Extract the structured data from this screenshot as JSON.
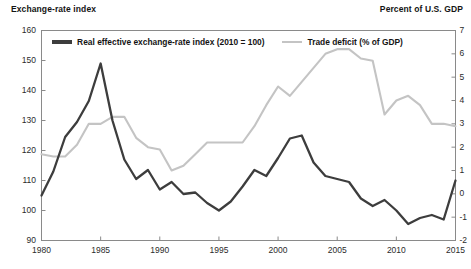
{
  "axis_titles": {
    "left": "Exchange-rate index",
    "right": "Percent of U.S. GDP"
  },
  "legend": {
    "items": [
      {
        "label": "Real effective exchange-rate index (2010 = 100)",
        "color": "#3d3d3d"
      },
      {
        "label": "Trade deficit (% of GDP)",
        "color": "#c4c4c4"
      }
    ]
  },
  "chart_data": {
    "type": "line",
    "title": "",
    "subtitle": "",
    "xlabel": "",
    "ylabel": "Exchange-rate index",
    "y2label": "Percent of U.S. GDP",
    "grid": false,
    "legend_position": "top-center-inside",
    "xlim": [
      1980,
      2015
    ],
    "xticks": [
      1980,
      1985,
      1990,
      1995,
      2000,
      2005,
      2010,
      2015
    ],
    "xticklabels": [
      "1980",
      "1985",
      "1990",
      "1995",
      "2000",
      "2005",
      "2010",
      "2015"
    ],
    "ylim": [
      90,
      160
    ],
    "yticks": [
      90,
      100,
      110,
      120,
      130,
      140,
      150,
      160
    ],
    "yticklabels": [
      "90",
      "100",
      "110",
      "120",
      "130",
      "140",
      "150",
      "160"
    ],
    "y2lim": [
      -2,
      7
    ],
    "y2ticks": [
      -2,
      -1,
      0,
      1,
      2,
      3,
      4,
      5,
      6,
      7
    ],
    "y2ticklabels": [
      "-2",
      "-1",
      "0",
      "1",
      "2",
      "3",
      "4",
      "5",
      "6",
      "7"
    ],
    "x": [
      1980,
      1981,
      1982,
      1983,
      1984,
      1985,
      1986,
      1987,
      1988,
      1989,
      1990,
      1991,
      1992,
      1993,
      1994,
      1995,
      1996,
      1997,
      1998,
      1999,
      2000,
      2001,
      2002,
      2003,
      2004,
      2005,
      2006,
      2007,
      2008,
      2009,
      2010,
      2011,
      2012,
      2013,
      2014,
      2015
    ],
    "series": [
      {
        "name": "Real effective exchange-rate index (2010 = 100)",
        "axis": "left",
        "color": "#3d3d3d",
        "values": [
          105.0,
          113.0,
          124.5,
          129.5,
          136.5,
          149.0,
          130.0,
          117.0,
          110.5,
          113.5,
          107.0,
          109.5,
          105.5,
          106.0,
          102.5,
          100.0,
          103.0,
          108.0,
          113.5,
          111.5,
          117.5,
          124.0,
          125.0,
          116.0,
          111.5,
          110.5,
          109.5,
          104.0,
          101.5,
          103.5,
          100.0,
          95.5,
          97.5,
          98.5,
          97.0,
          110.0
        ]
      },
      {
        "name": "Trade deficit (% of GDP)",
        "axis": "right",
        "color": "#c4c4c4",
        "values": [
          1.7,
          1.6,
          1.6,
          2.1,
          3.0,
          3.0,
          3.3,
          3.3,
          2.4,
          2.0,
          1.9,
          1.0,
          1.2,
          1.7,
          2.2,
          2.2,
          2.2,
          2.2,
          2.9,
          3.8,
          4.6,
          4.2,
          4.8,
          5.4,
          6.0,
          6.2,
          6.2,
          5.8,
          5.7,
          3.4,
          4.0,
          4.2,
          3.8,
          3.0,
          3.0,
          2.9
        ]
      }
    ]
  }
}
